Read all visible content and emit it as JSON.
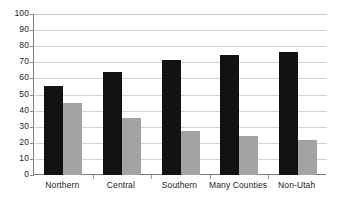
{
  "chart_data": {
    "type": "bar",
    "title": "",
    "subtitle": "",
    "xlabel": "",
    "ylabel": "",
    "ylim": [
      0,
      100
    ],
    "yticks": [
      0,
      10,
      20,
      30,
      40,
      50,
      60,
      70,
      80,
      90,
      100
    ],
    "grid": true,
    "legend": "none",
    "categories": [
      "Northern",
      "Central",
      "Southern",
      "Many Counties",
      "Non-Utah"
    ],
    "series": [
      {
        "name": "series-a",
        "color": "#121212",
        "values": [
          55,
          64,
          71.5,
          74.5,
          76.5
        ]
      },
      {
        "name": "series-b",
        "color": "#a3a3a3",
        "values": [
          45,
          35.5,
          27.5,
          24.5,
          22
        ]
      }
    ]
  },
  "axis": {
    "y_tick_labels": [
      "100",
      "90",
      "80",
      "70",
      "60",
      "50",
      "40",
      "30",
      "20",
      "10",
      "0"
    ]
  },
  "colors": {
    "series_a": "#121212",
    "series_b": "#a3a3a3",
    "gridline": "#d2d2d2",
    "axis": "#7a7a7a",
    "background": "#ffffff",
    "text": "#1c1c1c"
  }
}
